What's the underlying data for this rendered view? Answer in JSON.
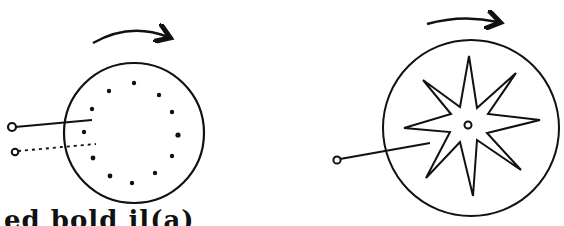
{
  "figure": {
    "left_panel": {
      "description": "rotating disc with ring of dots",
      "rotation": "clockwise",
      "circle": {
        "cx": 134,
        "cy": 133,
        "r": 70
      },
      "dots": [
        [
          134,
          83
        ],
        [
          159,
          95
        ],
        [
          172,
          112
        ],
        [
          178,
          135
        ],
        [
          172,
          156
        ],
        [
          155,
          173
        ],
        [
          132,
          183
        ],
        [
          110,
          176
        ],
        [
          93,
          158
        ],
        [
          84,
          132
        ],
        [
          92,
          109
        ],
        [
          109,
          91
        ]
      ],
      "probes": [
        {
          "style": "solid",
          "from": [
            12,
            127
          ],
          "to": [
            92,
            120
          ]
        },
        {
          "style": "dotted",
          "from": [
            15,
            152
          ],
          "to": [
            96,
            144
          ]
        }
      ]
    },
    "right_panel": {
      "description": "rotating disc with eight-pointed star cutout",
      "rotation": "clockwise",
      "circle": {
        "cx": 471,
        "cy": 128,
        "r": 88
      },
      "star_center": [
        468,
        125
      ],
      "star_points": 8,
      "probe": {
        "style": "solid",
        "from": [
          335,
          160
        ],
        "to": [
          430,
          143
        ]
      }
    },
    "caption_fragment": "ed  bold  il(a)"
  },
  "colors": {
    "ink": "#111111",
    "background": "#ffffff"
  }
}
